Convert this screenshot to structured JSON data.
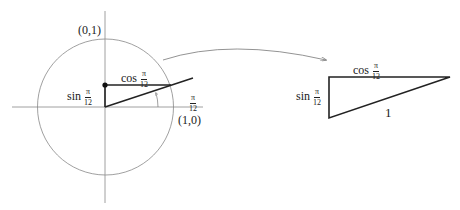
{
  "diagram": {
    "unit_circle": {
      "label_top": "(0,1)",
      "label_right": "(1,0)",
      "sin_label": {
        "fn": "sin",
        "num": "π",
        "den": "12"
      },
      "cos_label": {
        "fn": "cos",
        "num": "π",
        "den": "12"
      },
      "angle_label": {
        "num": "π",
        "den": "12"
      }
    },
    "triangle": {
      "top_label": {
        "fn": "cos",
        "num": "π",
        "den": "12"
      },
      "left_label": {
        "fn": "sin",
        "num": "π",
        "den": "12"
      },
      "hypotenuse_label": "1"
    },
    "colors": {
      "stroke": "#222222",
      "thin_stroke": "#777777",
      "background": "#ffffff"
    }
  }
}
